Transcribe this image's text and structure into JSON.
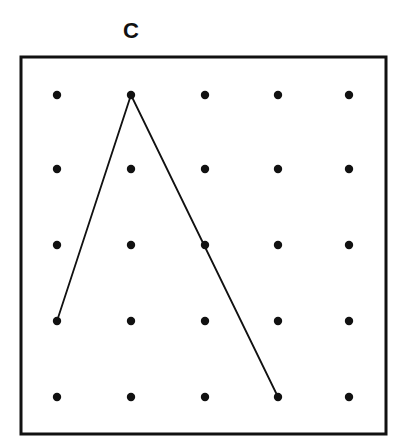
{
  "figure": {
    "label": "C",
    "grid": {
      "rows": 5,
      "cols": 5
    },
    "dots": {
      "xs": [
        57,
        131,
        205,
        278,
        349
      ],
      "ys": [
        95,
        169,
        245,
        321,
        397
      ]
    },
    "path": [
      {
        "col": 0,
        "row": 3
      },
      {
        "col": 1,
        "row": 0
      },
      {
        "col": 3,
        "row": 4
      }
    ],
    "colors": {
      "ink": "#111111",
      "background": "#ffffff"
    }
  }
}
